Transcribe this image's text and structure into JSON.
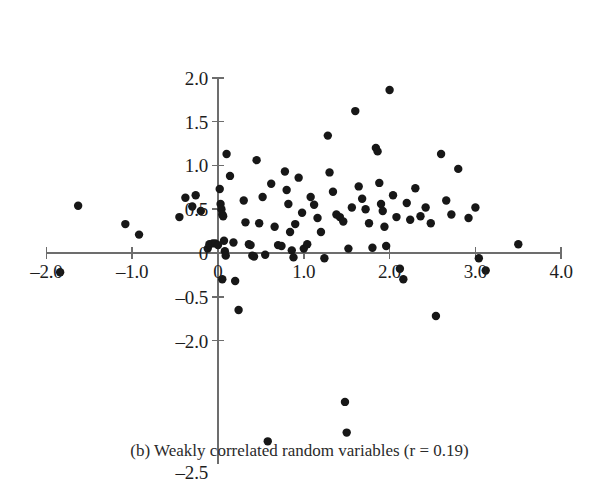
{
  "figure": {
    "caption": "(b) Weakly correlated random variables (r = 0.19)",
    "point_color": "#171717",
    "axis_color": "#6d6d6d",
    "background_color": "#ffffff"
  },
  "chart_data": {
    "type": "scatter",
    "title": "",
    "subtitle": "",
    "xlabel": "",
    "ylabel": "",
    "xlim": [
      -2.0,
      4.0
    ],
    "ylim": [
      -2.5,
      2.0
    ],
    "grid": false,
    "legend": null,
    "x_ticks": [
      -2.0,
      -1.0,
      0,
      1.0,
      2.0,
      3.0,
      4.0
    ],
    "x_tick_labels": [
      "–2.0",
      "–1.0",
      "0",
      "1.0",
      "2.0",
      "3.0",
      "4.0"
    ],
    "y_ticks": [
      2.0,
      1.5,
      1.0,
      0.5,
      0,
      -0.5,
      -1.0,
      -2.5
    ],
    "y_tick_labels": [
      "2.0",
      "1.5",
      "1.0",
      "0.5",
      "0",
      "–0.5",
      "–2.0",
      "–2.5"
    ],
    "annotation": "r = 0.19",
    "point_radius": 4.2,
    "points": [
      [
        -1.84,
        -0.22
      ],
      [
        -1.63,
        0.54
      ],
      [
        -1.08,
        0.33
      ],
      [
        -0.92,
        0.21
      ],
      [
        -0.45,
        0.41
      ],
      [
        -0.38,
        0.63
      ],
      [
        -0.3,
        0.53
      ],
      [
        -0.26,
        0.66
      ],
      [
        -0.2,
        0.48
      ],
      [
        -0.12,
        0.05
      ],
      [
        -0.1,
        0.1
      ],
      [
        -0.06,
        0.11
      ],
      [
        -0.03,
        0.11
      ],
      [
        0.0,
        0.09
      ],
      [
        0.02,
        0.73
      ],
      [
        0.03,
        0.56
      ],
      [
        0.04,
        0.5
      ],
      [
        0.05,
        0.44
      ],
      [
        0.06,
        0.42
      ],
      [
        0.07,
        0.14
      ],
      [
        0.08,
        0.02
      ],
      [
        0.09,
        -0.03
      ],
      [
        0.05,
        -0.3
      ],
      [
        0.1,
        1.13
      ],
      [
        0.14,
        0.88
      ],
      [
        0.18,
        0.12
      ],
      [
        0.2,
        -0.32
      ],
      [
        0.24,
        -0.65
      ],
      [
        0.3,
        0.6
      ],
      [
        0.32,
        0.35
      ],
      [
        0.36,
        0.1
      ],
      [
        0.38,
        0.09
      ],
      [
        0.4,
        -0.03
      ],
      [
        0.42,
        -0.04
      ],
      [
        0.45,
        1.06
      ],
      [
        0.48,
        0.34
      ],
      [
        0.52,
        0.64
      ],
      [
        0.55,
        -0.02
      ],
      [
        0.58,
        -2.15
      ],
      [
        0.62,
        0.79
      ],
      [
        0.66,
        0.3
      ],
      [
        0.7,
        0.09
      ],
      [
        0.74,
        0.08
      ],
      [
        0.78,
        0.93
      ],
      [
        0.8,
        0.72
      ],
      [
        0.82,
        0.56
      ],
      [
        0.84,
        0.24
      ],
      [
        0.86,
        0.03
      ],
      [
        0.88,
        -0.05
      ],
      [
        0.9,
        0.33
      ],
      [
        0.94,
        0.86
      ],
      [
        0.98,
        0.46
      ],
      [
        1.0,
        0.05
      ],
      [
        1.04,
        0.1
      ],
      [
        1.08,
        0.64
      ],
      [
        1.12,
        0.55
      ],
      [
        1.16,
        0.4
      ],
      [
        1.2,
        0.24
      ],
      [
        1.24,
        -0.06
      ],
      [
        1.28,
        1.34
      ],
      [
        1.3,
        0.92
      ],
      [
        1.34,
        0.7
      ],
      [
        1.38,
        0.44
      ],
      [
        1.42,
        0.41
      ],
      [
        1.46,
        0.36
      ],
      [
        1.48,
        -1.7
      ],
      [
        1.5,
        -2.05
      ],
      [
        1.52,
        0.05
      ],
      [
        1.56,
        0.52
      ],
      [
        1.6,
        1.62
      ],
      [
        1.64,
        0.76
      ],
      [
        1.68,
        0.62
      ],
      [
        1.72,
        0.5
      ],
      [
        1.76,
        0.34
      ],
      [
        1.8,
        0.06
      ],
      [
        1.84,
        1.2
      ],
      [
        1.86,
        1.16
      ],
      [
        1.88,
        0.8
      ],
      [
        1.9,
        0.56
      ],
      [
        1.92,
        0.48
      ],
      [
        1.94,
        0.3
      ],
      [
        1.96,
        0.08
      ],
      [
        2.0,
        1.86
      ],
      [
        2.04,
        0.66
      ],
      [
        2.08,
        0.41
      ],
      [
        2.12,
        -0.18
      ],
      [
        2.16,
        -0.3
      ],
      [
        2.2,
        0.57
      ],
      [
        2.24,
        0.38
      ],
      [
        2.3,
        0.74
      ],
      [
        2.36,
        0.42
      ],
      [
        2.42,
        0.52
      ],
      [
        2.48,
        0.34
      ],
      [
        2.54,
        -0.72
      ],
      [
        2.6,
        1.13
      ],
      [
        2.66,
        0.6
      ],
      [
        2.72,
        0.44
      ],
      [
        2.8,
        0.96
      ],
      [
        2.92,
        0.4
      ],
      [
        3.0,
        0.52
      ],
      [
        3.04,
        -0.06
      ],
      [
        3.12,
        -0.2
      ],
      [
        3.5,
        0.1
      ]
    ]
  }
}
